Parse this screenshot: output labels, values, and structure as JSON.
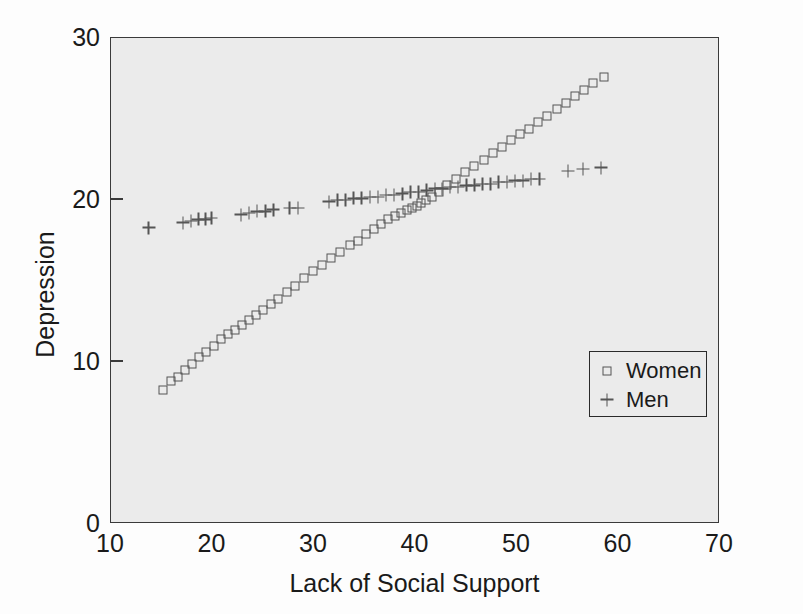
{
  "chart_data": {
    "type": "scatter",
    "title": "",
    "xlabel": "Lack of Social Support",
    "ylabel": "Depression",
    "xlim": [
      10,
      70
    ],
    "ylim": [
      0,
      30
    ],
    "xticks": [
      10,
      20,
      30,
      40,
      50,
      60,
      70
    ],
    "yticks": [
      0,
      10,
      20,
      30
    ],
    "grid": false,
    "legend_position": "center-right",
    "background_color": "#ebebeb",
    "marker_color": "#555555",
    "series": [
      {
        "name": "Women",
        "marker": "square",
        "points": [
          [
            15.1,
            8.3
          ],
          [
            15.9,
            8.8
          ],
          [
            16.6,
            9.1
          ],
          [
            17.3,
            9.5
          ],
          [
            18.0,
            9.9
          ],
          [
            18.7,
            10.3
          ],
          [
            19.4,
            10.6
          ],
          [
            20.1,
            11.0
          ],
          [
            20.8,
            11.4
          ],
          [
            21.5,
            11.7
          ],
          [
            22.2,
            12.0
          ],
          [
            22.9,
            12.3
          ],
          [
            23.6,
            12.6
          ],
          [
            24.3,
            12.9
          ],
          [
            25.0,
            13.2
          ],
          [
            25.8,
            13.6
          ],
          [
            26.5,
            13.9
          ],
          [
            27.3,
            14.3
          ],
          [
            28.1,
            14.7
          ],
          [
            29.0,
            15.2
          ],
          [
            29.9,
            15.6
          ],
          [
            30.8,
            16.0
          ],
          [
            31.7,
            16.4
          ],
          [
            32.6,
            16.8
          ],
          [
            33.5,
            17.2
          ],
          [
            34.3,
            17.5
          ],
          [
            35.1,
            17.9
          ],
          [
            35.9,
            18.2
          ],
          [
            36.6,
            18.5
          ],
          [
            37.3,
            18.8
          ],
          [
            38.0,
            19.0
          ],
          [
            38.6,
            19.2
          ],
          [
            39.2,
            19.4
          ],
          [
            39.7,
            19.5
          ],
          [
            40.1,
            19.6
          ],
          [
            40.5,
            19.8
          ],
          [
            41.0,
            20.0
          ],
          [
            41.6,
            20.2
          ],
          [
            42.3,
            20.5
          ],
          [
            43.1,
            20.9
          ],
          [
            44.0,
            21.3
          ],
          [
            44.9,
            21.7
          ],
          [
            45.8,
            22.1
          ],
          [
            46.7,
            22.5
          ],
          [
            47.6,
            22.9
          ],
          [
            48.5,
            23.3
          ],
          [
            49.4,
            23.7
          ],
          [
            50.3,
            24.1
          ],
          [
            51.2,
            24.4
          ],
          [
            52.1,
            24.8
          ],
          [
            53.0,
            25.2
          ],
          [
            53.9,
            25.6
          ],
          [
            54.8,
            26.0
          ],
          [
            55.7,
            26.4
          ],
          [
            56.6,
            26.8
          ],
          [
            57.5,
            27.2
          ],
          [
            58.6,
            27.6
          ]
        ]
      },
      {
        "name": "Men",
        "marker": "plus",
        "points": [
          [
            13.7,
            18.3
          ],
          [
            17.1,
            18.6
          ],
          [
            17.9,
            18.7
          ],
          [
            18.6,
            18.8
          ],
          [
            19.3,
            18.8
          ],
          [
            19.9,
            18.9
          ],
          [
            22.8,
            19.1
          ],
          [
            23.6,
            19.2
          ],
          [
            24.4,
            19.3
          ],
          [
            25.2,
            19.3
          ],
          [
            26.0,
            19.4
          ],
          [
            27.6,
            19.5
          ],
          [
            28.4,
            19.5
          ],
          [
            31.5,
            19.9
          ],
          [
            32.3,
            20.0
          ],
          [
            33.1,
            20.0
          ],
          [
            33.9,
            20.1
          ],
          [
            34.7,
            20.1
          ],
          [
            35.5,
            20.2
          ],
          [
            36.3,
            20.2
          ],
          [
            37.1,
            20.3
          ],
          [
            37.9,
            20.3
          ],
          [
            38.7,
            20.4
          ],
          [
            39.5,
            20.5
          ],
          [
            40.3,
            20.5
          ],
          [
            41.1,
            20.6
          ],
          [
            41.9,
            20.7
          ],
          [
            42.6,
            20.7
          ],
          [
            43.4,
            20.8
          ],
          [
            44.2,
            20.8
          ],
          [
            45.0,
            20.9
          ],
          [
            45.8,
            20.9
          ],
          [
            46.6,
            21.0
          ],
          [
            47.4,
            21.0
          ],
          [
            48.2,
            21.1
          ],
          [
            49.0,
            21.1
          ],
          [
            49.8,
            21.2
          ],
          [
            50.6,
            21.2
          ],
          [
            51.4,
            21.3
          ],
          [
            52.2,
            21.3
          ],
          [
            55.0,
            21.8
          ],
          [
            56.5,
            21.9
          ],
          [
            58.3,
            22.0
          ]
        ]
      }
    ]
  },
  "legend": {
    "items": [
      {
        "label": "Women",
        "marker": "square"
      },
      {
        "label": "Men",
        "marker": "plus"
      }
    ]
  }
}
